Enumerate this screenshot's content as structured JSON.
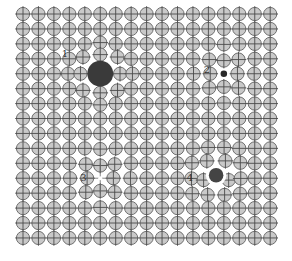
{
  "figure": {
    "title": "",
    "lattice": {
      "columns": 17,
      "rows": 16,
      "atom_color": "#c9c9c9",
      "atom_outline_color": "#6e6e6e",
      "cross_color": "#4a4a4a"
    },
    "defects": [
      {
        "label": "1",
        "type": "large-substitutional-atom",
        "site": {
          "col": 5,
          "row": 4
        },
        "relative_size": 1.7,
        "color": "#3a3a3a",
        "label_site": {
          "col": 2.5,
          "row": 2.6
        }
      },
      {
        "label": "2",
        "type": "small-substitutional-atom",
        "site": {
          "col": 13,
          "row": 4
        },
        "relative_size": 0.45,
        "color": "#2a2a2a",
        "label_site": {
          "col": 11.7,
          "row": 3.7
        }
      },
      {
        "label": "3",
        "type": "vacancy",
        "site": {
          "col": 5,
          "row": 11
        },
        "relative_size": 0,
        "color": "#ffffff",
        "label_site": {
          "col": 3.7,
          "row": 10.9
        }
      },
      {
        "label": "4",
        "type": "interstitial-atom",
        "site": {
          "col": 12.5,
          "row": 10.8
        },
        "relative_size": 1.0,
        "color": "#444444",
        "label_site": {
          "col": 10.6,
          "row": 10.9
        }
      }
    ]
  }
}
